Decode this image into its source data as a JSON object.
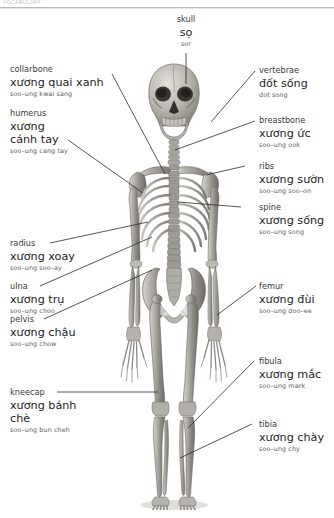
{
  "page": {
    "header_fragment": "VOCABULARY",
    "width": 334,
    "height": 518,
    "background": "#ffffff",
    "text_color": "#1c1c1c",
    "leader_color": "#2b2b2b"
  },
  "figure": {
    "name": "human-skeleton",
    "view": "anterior"
  },
  "labels": {
    "skull": {
      "en": "skull",
      "vi": "sọ",
      "pr": "sor"
    },
    "collarbone": {
      "en": "collarbone",
      "vi": "xương quai xanh",
      "pr": "soo–ung kwai sang"
    },
    "humerus": {
      "en": "humerus",
      "vi": "xương cánh tay",
      "pr": "soo–ung cang tay"
    },
    "radius": {
      "en": "radius",
      "vi": "xương xoay",
      "pr": "soo–ung soo–ay"
    },
    "ulna": {
      "en": "ulna",
      "vi": "xương trụ",
      "pr": "soo–ung choo"
    },
    "pelvis": {
      "en": "pelvis",
      "vi": "xương chậu",
      "pr": "soo–ung chow"
    },
    "kneecap": {
      "en": "kneecap",
      "vi": "xương bánh chè",
      "pr": "soo–ung bun cheh"
    },
    "vertebrae": {
      "en": "vertebrae",
      "vi": "đốt sống",
      "pr": "dot song"
    },
    "breastbone": {
      "en": "breastbone",
      "vi": "xương ức",
      "pr": "soo–ung ook"
    },
    "ribs": {
      "en": "ribs",
      "vi": "xương sườn",
      "pr": "soo–ung soo–on"
    },
    "spine": {
      "en": "spine",
      "vi": "xương sống",
      "pr": "soo–ung song"
    },
    "femur": {
      "en": "femur",
      "vi": "xương đùi",
      "pr": "soo–ung doo–ee"
    },
    "fibula": {
      "en": "fibula",
      "vi": "xương mắc",
      "pr": "soo–ung mark"
    },
    "tibia": {
      "en": "tibia",
      "vi": "xương chày",
      "pr": "soo–ung chy"
    }
  }
}
